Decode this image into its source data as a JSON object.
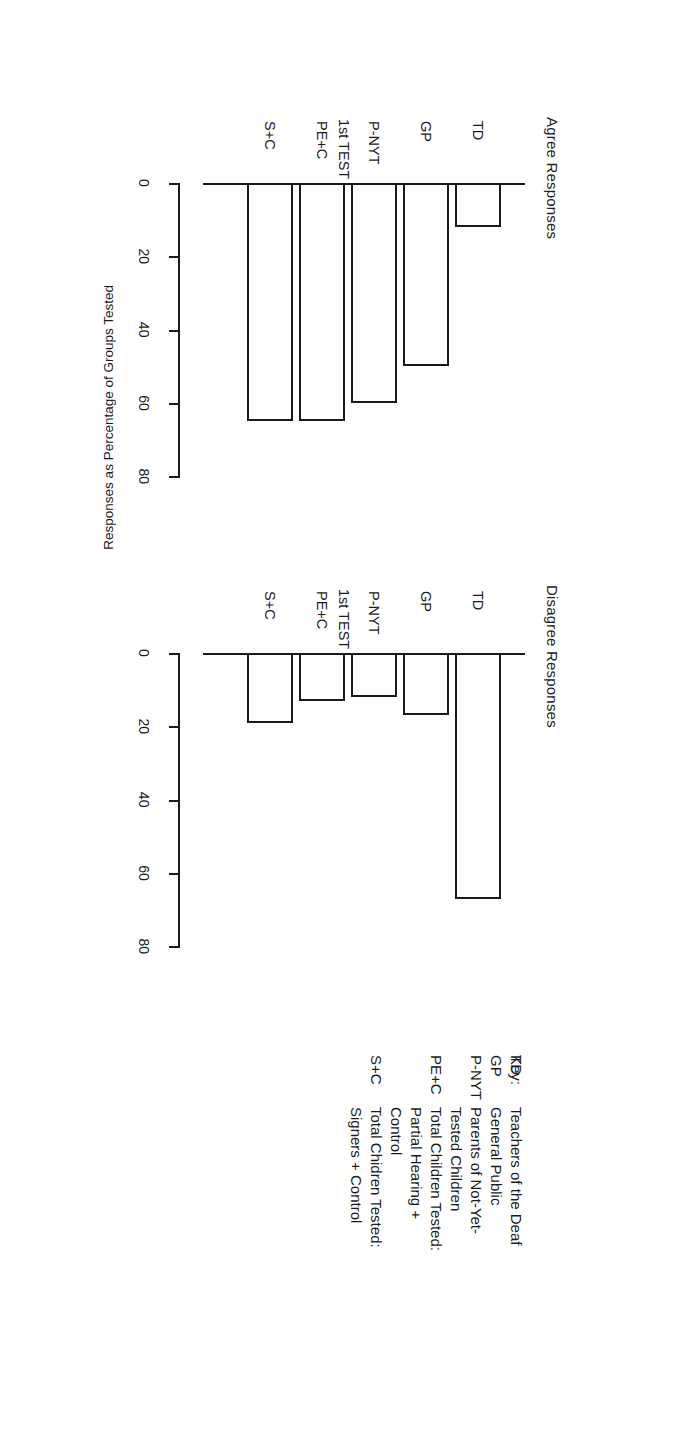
{
  "figure": {
    "panels": [
      {
        "id": "agree",
        "title": "Agree Responses"
      },
      {
        "id": "disagree",
        "title": "Disagree Responses"
      }
    ],
    "y_axis_title": "Responses as Percentage of Groups Tested",
    "x_axis_caption": "1st TEST"
  },
  "key": {
    "heading": "Key:",
    "entries": [
      {
        "abbr": "TD",
        "lines": [
          "Teachers of the Deaf"
        ]
      },
      {
        "abbr": "GP",
        "lines": [
          "General Public"
        ]
      },
      {
        "abbr": "P-NYT",
        "lines": [
          "Parents of Not-Yet-",
          "Tested Children"
        ]
      },
      {
        "abbr": "PE+C",
        "lines": [
          "Total Children Tested:",
          "Partial Hearing +",
          "Control"
        ]
      },
      {
        "abbr": "S+C",
        "lines": [
          "Total Chidren Tested:",
          "Signers + Control"
        ]
      }
    ]
  },
  "chart_data": [
    {
      "type": "bar",
      "orientation": "horizontal",
      "title": "Agree Responses",
      "categories": [
        "TD",
        "GP",
        "P-NYT",
        "PE+C",
        "S+C"
      ],
      "values": [
        12,
        50,
        60,
        65,
        65
      ],
      "xlabel": "1st TEST",
      "ylabel": "Responses as Percentage of Groups Tested",
      "ylim": [
        0,
        90
      ],
      "ticks": [
        0,
        20,
        40,
        60,
        80
      ],
      "ticklabels": [
        "0",
        "20",
        "40",
        "60",
        "80"
      ],
      "grid": false,
      "legend": "none"
    },
    {
      "type": "bar",
      "orientation": "horizontal",
      "title": "Disagree Responses",
      "categories": [
        "TD",
        "GP",
        "P-NYT",
        "PE+C",
        "S+C"
      ],
      "values": [
        67,
        17,
        12,
        13,
        19
      ],
      "xlabel": "1st TEST",
      "ylabel": "Responses as Percentage of Groups Tested",
      "ylim": [
        0,
        90
      ],
      "ticks": [
        0,
        20,
        40,
        60,
        80
      ],
      "ticklabels": [
        "0",
        "20",
        "40",
        "60",
        "80"
      ],
      "grid": false,
      "legend": "none"
    }
  ]
}
